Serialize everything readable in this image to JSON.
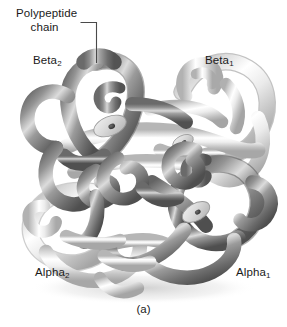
{
  "figure": {
    "caption": "(a)",
    "background_color": "#ffffff"
  },
  "labels": {
    "polypeptide_line1": "Polypeptide",
    "polypeptide_line2": "chain",
    "beta2": "Beta",
    "beta2_sub": "2",
    "beta1": "Beta",
    "beta1_sub": "1",
    "alpha2": "Alpha",
    "alpha2_sub": "2",
    "alpha1": "Alpha",
    "alpha1_sub": "1"
  },
  "colors": {
    "text": "#1a1a1a",
    "leader_line": "#4a4a4a",
    "dark_chain_shadow": "#4f4f4f",
    "dark_chain_mid": "#8e8e8e",
    "dark_chain_highlight": "#ececec",
    "light_chain_shadow": "#b4b4b4",
    "light_chain_mid": "#dcdcdc",
    "light_chain_highlight": "#ffffff",
    "heme_disc": "#d8d8d8",
    "heme_iron": "#3a3a3a",
    "background": "#ffffff"
  },
  "structure": {
    "subunits": [
      {
        "name": "Beta",
        "subscript": "2",
        "shade": "dark",
        "position": "upper-left"
      },
      {
        "name": "Beta",
        "subscript": "1",
        "shade": "light",
        "position": "upper-right"
      },
      {
        "name": "Alpha",
        "subscript": "2",
        "shade": "light",
        "position": "lower-left"
      },
      {
        "name": "Alpha",
        "subscript": "1",
        "shade": "dark",
        "position": "lower-right"
      }
    ],
    "heme_groups": 4,
    "annotation_target": "polypeptide chain tube at top center"
  }
}
